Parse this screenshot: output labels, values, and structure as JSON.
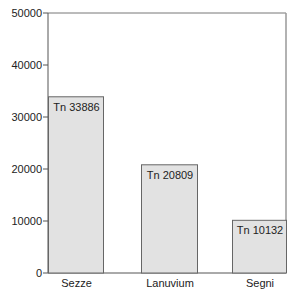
{
  "chart_data": {
    "type": "bar",
    "title": "",
    "xlabel": "",
    "ylabel": "",
    "categories": [
      "Sezze",
      "Lanuvium",
      "Segni"
    ],
    "values": [
      33886,
      20809,
      10132
    ],
    "bar_labels": [
      "Tn 33886",
      "Tn 20809",
      "Tn 10132"
    ],
    "ylim": [
      0,
      50000
    ],
    "yticks": [
      0,
      10000,
      20000,
      30000,
      40000,
      50000
    ],
    "ytick_labels": [
      "0",
      "10000",
      "20000",
      "30000",
      "40000",
      "50000"
    ],
    "grid": false,
    "legend": null,
    "bar_color": "#e2e2e2",
    "bar_edge_color": "#666666"
  }
}
